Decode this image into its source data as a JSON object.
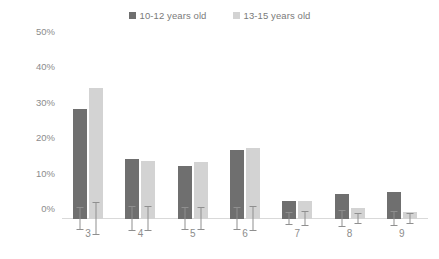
{
  "legend": {
    "position": "top-center",
    "entries": [
      {
        "label": "10-12 years old",
        "color": "#6f6f6f"
      },
      {
        "label": "13-15 years old",
        "color": "#d3d3d3"
      }
    ]
  },
  "axes": {
    "y_ticks": [
      "0%",
      "10%",
      "20%",
      "30%",
      "40%",
      "50%"
    ],
    "x_ticks": [
      "3",
      "4",
      "5",
      "6",
      "7",
      "8",
      "9"
    ]
  },
  "colors": {
    "series_1": "#6f6f6f",
    "series_2": "#d3d3d3",
    "error_bar": "#8f8f8f",
    "axis_line": "#d9d9d9",
    "tick_text": "#8c8c8c"
  },
  "chart_data": {
    "type": "bar",
    "title": "",
    "subtitle": "",
    "xlabel": "",
    "ylabel": "",
    "ylim": [
      0,
      50
    ],
    "yunit": "%",
    "ytick_step": 10,
    "grid": false,
    "legend_position": "top-center",
    "error_bars": true,
    "categories": [
      "3",
      "4",
      "5",
      "6",
      "7",
      "8",
      "9"
    ],
    "series": [
      {
        "name": "10-12 years old",
        "color": "#6f6f6f",
        "values": [
          31,
          17,
          15,
          19.5,
          5,
          7,
          7.5
        ],
        "errors": [
          3.0,
          3.5,
          3.0,
          3.0,
          1.8,
          2.2,
          2.0
        ]
      },
      {
        "name": "13-15 years old",
        "color": "#d3d3d3",
        "values": [
          37,
          16.5,
          16,
          20,
          5,
          3,
          2
        ],
        "errors": [
          4.5,
          3.5,
          3.0,
          3.5,
          2.0,
          1.5,
          1.3
        ]
      }
    ]
  }
}
